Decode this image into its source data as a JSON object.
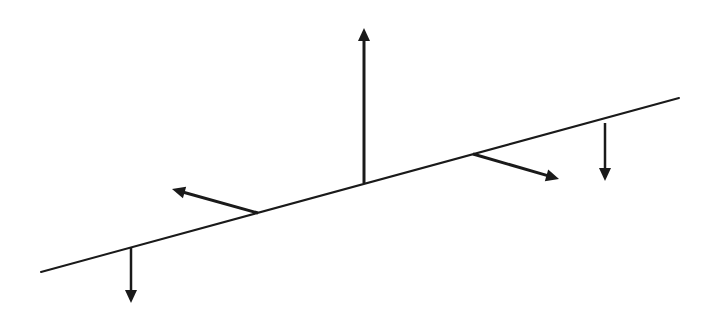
{
  "diagram": {
    "type": "vector-diagram",
    "background": "#ffffff",
    "stroke_color": "#1a1a1a",
    "baseline": {
      "x1": 41,
      "y1": 272,
      "x2": 679,
      "y2": 98,
      "width": 2
    },
    "arrows": [
      {
        "id": "arrow-down-left",
        "direction": "down",
        "x1": 131,
        "y1": 247,
        "x2": 131,
        "y2": 303,
        "width": 2.5
      },
      {
        "id": "arrow-normal-left",
        "direction": "up-left",
        "x1": 258,
        "y1": 213,
        "x2": 172,
        "y2": 189,
        "width": 3
      },
      {
        "id": "arrow-up-center",
        "direction": "up",
        "x1": 364,
        "y1": 183,
        "x2": 364,
        "y2": 28,
        "width": 3
      },
      {
        "id": "arrow-normal-right",
        "direction": "down-right",
        "x1": 473,
        "y1": 154,
        "x2": 559,
        "y2": 179,
        "width": 3
      },
      {
        "id": "arrow-down-right",
        "direction": "down",
        "x1": 605,
        "y1": 123,
        "x2": 605,
        "y2": 181,
        "width": 2.5
      }
    ]
  }
}
